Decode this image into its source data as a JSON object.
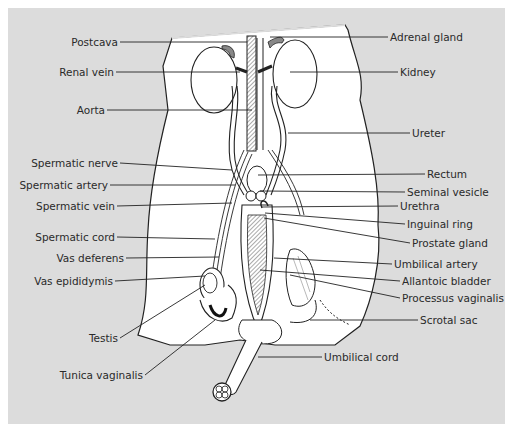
{
  "figure": {
    "background_color": "#dcdcdc",
    "body_color": "#ffffff",
    "line_color": "#222222"
  },
  "labels_left": [
    {
      "id": "postcava",
      "text": "Postcava"
    },
    {
      "id": "renal-vein",
      "text": "Renal vein"
    },
    {
      "id": "aorta",
      "text": "Aorta"
    },
    {
      "id": "spermatic-nerve",
      "text": "Spermatic nerve"
    },
    {
      "id": "spermatic-artery",
      "text": "Spermatic artery"
    },
    {
      "id": "spermatic-vein",
      "text": "Spermatic vein"
    },
    {
      "id": "spermatic-cord",
      "text": "Spermatic cord"
    },
    {
      "id": "vas-deferens",
      "text": "Vas deferens"
    },
    {
      "id": "vas-epididymis",
      "text": "Vas epididymis"
    },
    {
      "id": "testis",
      "text": "Testis"
    },
    {
      "id": "tunica-vaginalis",
      "text": "Tunica vaginalis"
    }
  ],
  "labels_right": [
    {
      "id": "adrenal-gland",
      "text": "Adrenal gland"
    },
    {
      "id": "kidney",
      "text": "Kidney"
    },
    {
      "id": "ureter",
      "text": "Ureter"
    },
    {
      "id": "rectum",
      "text": "Rectum"
    },
    {
      "id": "seminal-vesicle",
      "text": "Seminal vesicle"
    },
    {
      "id": "urethra",
      "text": "Urethra"
    },
    {
      "id": "inguinal-ring",
      "text": "Inguinal ring"
    },
    {
      "id": "prostate-gland",
      "text": "Prostate gland"
    },
    {
      "id": "umbilical-artery",
      "text": "Umbilical artery"
    },
    {
      "id": "allantoic-bladder",
      "text": "Allantoic bladder"
    },
    {
      "id": "processus-vaginalis",
      "text": "Processus vaginalis"
    },
    {
      "id": "scrotal-sac",
      "text": "Scrotal sac"
    },
    {
      "id": "umbilical-cord",
      "text": "Umbilical cord"
    }
  ]
}
